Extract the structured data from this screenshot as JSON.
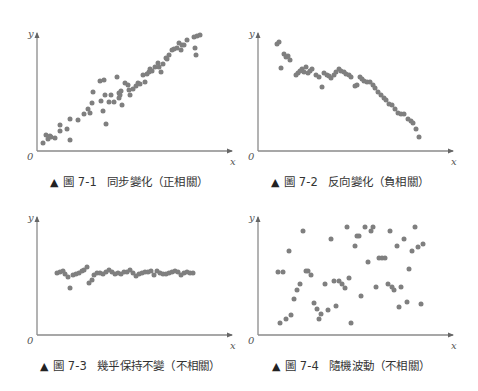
{
  "figures": [
    {
      "id": "7-1",
      "label": "圖 7-1",
      "title": "同步變化（正相關）",
      "marker": "▲"
    },
    {
      "id": "7-2",
      "label": "圖 7-2",
      "title": "反向變化（負相關）",
      "marker": "▲"
    },
    {
      "id": "7-3",
      "label": "圖 7-3",
      "title": "幾乎保持不變（不相關）",
      "marker": "▲"
    },
    {
      "id": "7-4",
      "label": "圖 7-4",
      "title": "隨機波動（不相關）",
      "marker": "▲"
    }
  ],
  "axes": {
    "x_label": "x",
    "y_label": "y",
    "origin_label": "0"
  },
  "colors": {
    "dot": "#7f7f7f",
    "axis": "#8a8a8a",
    "text": "#333333"
  },
  "chart_data": [
    {
      "type": "scatter",
      "title": "圖 7-1 同步變化（正相關）",
      "xlabel": "x",
      "ylabel": "y",
      "grid": false,
      "xlim": [
        0,
        195
      ],
      "ylim": [
        0,
        118
      ],
      "points": [
        [
          6,
          8
        ],
        [
          9,
          16
        ],
        [
          11,
          12
        ],
        [
          13,
          15
        ],
        [
          14,
          14
        ],
        [
          18,
          13
        ],
        [
          23,
          20
        ],
        [
          23,
          26
        ],
        [
          30,
          22
        ],
        [
          33,
          11
        ],
        [
          33,
          32
        ],
        [
          41,
          31
        ],
        [
          47,
          37
        ],
        [
          51,
          42
        ],
        [
          53,
          38
        ],
        [
          55,
          48
        ],
        [
          56,
          59
        ],
        [
          63,
          70
        ],
        [
          64,
          50
        ],
        [
          66,
          40
        ],
        [
          67,
          71
        ],
        [
          68,
          56
        ],
        [
          69,
          27
        ],
        [
          72,
          49
        ],
        [
          74,
          56
        ],
        [
          77,
          49
        ],
        [
          80,
          74
        ],
        [
          82,
          58
        ],
        [
          82,
          53
        ],
        [
          83,
          56
        ],
        [
          84,
          60
        ],
        [
          85,
          46
        ],
        [
          88,
          68
        ],
        [
          91,
          66
        ],
        [
          92,
          61
        ],
        [
          93,
          56
        ],
        [
          96,
          62
        ],
        [
          99,
          65
        ],
        [
          101,
          68
        ],
        [
          103,
          67
        ],
        [
          106,
          76
        ],
        [
          108,
          69
        ],
        [
          110,
          77
        ],
        [
          112,
          79
        ],
        [
          113,
          82
        ],
        [
          115,
          80
        ],
        [
          118,
          84
        ],
        [
          121,
          88
        ],
        [
          122,
          84
        ],
        [
          124,
          79
        ],
        [
          126,
          87
        ],
        [
          129,
          93
        ],
        [
          130,
          92
        ],
        [
          132,
          96
        ],
        [
          135,
          101
        ],
        [
          137,
          102
        ],
        [
          140,
          103
        ],
        [
          142,
          108
        ],
        [
          144,
          101
        ],
        [
          145,
          106
        ],
        [
          147,
          106
        ],
        [
          150,
          111
        ],
        [
          157,
          114
        ],
        [
          158,
          103
        ],
        [
          159,
          96
        ],
        [
          160,
          115
        ],
        [
          163,
          116
        ]
      ]
    },
    {
      "type": "scatter",
      "title": "圖 7-2 反向變化（負相關）",
      "xlabel": "x",
      "ylabel": "y",
      "grid": false,
      "xlim": [
        0,
        195
      ],
      "ylim": [
        0,
        118
      ],
      "points": [
        [
          19,
          107
        ],
        [
          21,
          109
        ],
        [
          23,
          83
        ],
        [
          26,
          97
        ],
        [
          28,
          94
        ],
        [
          30,
          95
        ],
        [
          32,
          91
        ],
        [
          38,
          76
        ],
        [
          40,
          78
        ],
        [
          42,
          80
        ],
        [
          44,
          82
        ],
        [
          46,
          79
        ],
        [
          48,
          84
        ],
        [
          50,
          78
        ],
        [
          52,
          80
        ],
        [
          54,
          82
        ],
        [
          58,
          76
        ],
        [
          61,
          74
        ],
        [
          64,
          64
        ],
        [
          66,
          78
        ],
        [
          69,
          76
        ],
        [
          71,
          75
        ],
        [
          73,
          73
        ],
        [
          76,
          76
        ],
        [
          78,
          79
        ],
        [
          81,
          82
        ],
        [
          83,
          80
        ],
        [
          86,
          79
        ],
        [
          88,
          77
        ],
        [
          91,
          76
        ],
        [
          93,
          74
        ],
        [
          97,
          65
        ],
        [
          99,
          66
        ],
        [
          102,
          74
        ],
        [
          104,
          72
        ],
        [
          106,
          70
        ],
        [
          109,
          69
        ],
        [
          112,
          69
        ],
        [
          115,
          66
        ],
        [
          117,
          63
        ],
        [
          120,
          59
        ],
        [
          123,
          56
        ],
        [
          126,
          53
        ],
        [
          128,
          51
        ],
        [
          131,
          47
        ],
        [
          134,
          46
        ],
        [
          137,
          42
        ],
        [
          140,
          38
        ],
        [
          143,
          37
        ],
        [
          146,
          37
        ],
        [
          150,
          32
        ],
        [
          153,
          30
        ],
        [
          155,
          28
        ],
        [
          158,
          22
        ],
        [
          161,
          14
        ]
      ]
    },
    {
      "type": "scatter",
      "title": "圖 7-3 幾乎保持不變（不相關）",
      "xlabel": "x",
      "ylabel": "y",
      "grid": false,
      "xlim": [
        0,
        195
      ],
      "ylim": [
        0,
        118
      ],
      "points": [
        [
          20,
          62
        ],
        [
          23,
          63
        ],
        [
          26,
          64
        ],
        [
          28,
          61
        ],
        [
          31,
          58
        ],
        [
          33,
          47
        ],
        [
          36,
          60
        ],
        [
          39,
          61
        ],
        [
          42,
          62
        ],
        [
          45,
          64
        ],
        [
          47,
          65
        ],
        [
          50,
          68
        ],
        [
          52,
          52
        ],
        [
          55,
          55
        ],
        [
          57,
          60
        ],
        [
          60,
          62
        ],
        [
          63,
          62
        ],
        [
          66,
          61
        ],
        [
          69,
          63
        ],
        [
          72,
          65
        ],
        [
          75,
          63
        ],
        [
          78,
          61
        ],
        [
          81,
          62
        ],
        [
          84,
          61
        ],
        [
          87,
          63
        ],
        [
          90,
          63
        ],
        [
          93,
          65
        ],
        [
          96,
          62
        ],
        [
          99,
          59
        ],
        [
          102,
          61
        ],
        [
          105,
          62
        ],
        [
          108,
          63
        ],
        [
          111,
          63
        ],
        [
          114,
          64
        ],
        [
          117,
          60
        ],
        [
          120,
          64
        ],
        [
          123,
          62
        ],
        [
          126,
          61
        ],
        [
          129,
          61
        ],
        [
          132,
          62
        ],
        [
          135,
          63
        ],
        [
          138,
          64
        ],
        [
          141,
          63
        ],
        [
          144,
          60
        ],
        [
          147,
          62
        ],
        [
          150,
          63
        ],
        [
          153,
          62
        ],
        [
          156,
          62
        ]
      ]
    },
    {
      "type": "scatter",
      "title": "圖 7-4 隨機波動（不相關）",
      "xlabel": "x",
      "ylabel": "y",
      "grid": false,
      "xlim": [
        0,
        195
      ],
      "ylim": [
        0,
        118
      ],
      "points": [
        [
          20,
          63
        ],
        [
          25,
          63
        ],
        [
          22,
          12
        ],
        [
          28,
          16
        ],
        [
          31,
          84
        ],
        [
          33,
          20
        ],
        [
          36,
          36
        ],
        [
          39,
          45
        ],
        [
          42,
          51
        ],
        [
          45,
          104
        ],
        [
          48,
          64
        ],
        [
          50,
          64
        ],
        [
          53,
          60
        ],
        [
          56,
          32
        ],
        [
          59,
          26
        ],
        [
          61,
          16
        ],
        [
          63,
          21
        ],
        [
          67,
          51
        ],
        [
          70,
          25
        ],
        [
          73,
          96
        ],
        [
          76,
          54
        ],
        [
          78,
          29
        ],
        [
          81,
          54
        ],
        [
          84,
          51
        ],
        [
          87,
          47
        ],
        [
          89,
          108
        ],
        [
          91,
          57
        ],
        [
          93,
          12
        ],
        [
          97,
          89
        ],
        [
          99,
          99
        ],
        [
          101,
          99
        ],
        [
          103,
          39
        ],
        [
          107,
          108
        ],
        [
          110,
          73
        ],
        [
          113,
          104
        ],
        [
          115,
          108
        ],
        [
          118,
          48
        ],
        [
          121,
          77
        ],
        [
          124,
          77
        ],
        [
          127,
          77
        ],
        [
          130,
          51
        ],
        [
          132,
          104
        ],
        [
          134,
          48
        ],
        [
          136,
          45
        ],
        [
          139,
          89
        ],
        [
          141,
          28
        ],
        [
          143,
          48
        ],
        [
          146,
          96
        ],
        [
          149,
          33
        ],
        [
          151,
          66
        ],
        [
          154,
          84
        ],
        [
          157,
          108
        ],
        [
          160,
          88
        ],
        [
          163,
          31
        ],
        [
          165,
          91
        ]
      ]
    }
  ]
}
